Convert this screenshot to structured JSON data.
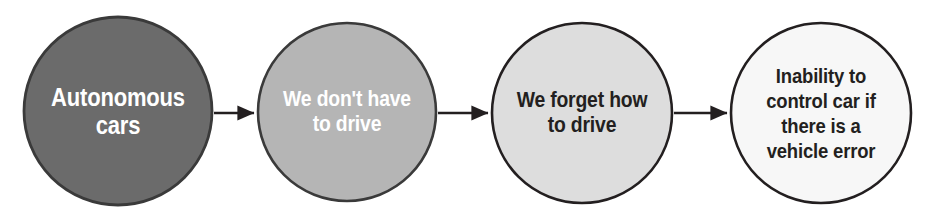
{
  "diagram": {
    "type": "flowchart",
    "orientation": "left-to-right",
    "title": "",
    "background_color": "#ffffff",
    "nodes": [
      {
        "id": "node-1",
        "shape": "circle",
        "label": "Autonomous\ncars",
        "fill_color": "#6b6b6b",
        "stroke_color": "#3a3a3a",
        "text_color": "#ffffff",
        "cx": 118,
        "cy": 111,
        "r": 94
      },
      {
        "id": "node-2",
        "shape": "circle",
        "label": "We don't have\nto drive",
        "fill_color": "#b5b5b5",
        "stroke_color": "#3a3a3a",
        "text_color": "#ffffff",
        "cx": 347,
        "cy": 112,
        "r": 89
      },
      {
        "id": "node-3",
        "shape": "circle",
        "label": "We forget how\nto drive",
        "fill_color": "#dddddd",
        "stroke_color": "#231f20",
        "text_color": "#231f20",
        "cx": 582,
        "cy": 113,
        "r": 90
      },
      {
        "id": "node-4",
        "shape": "circle",
        "label": "Inability to\ncontrol car if\nthere is a\nvehicle error",
        "fill_color": "#f7f7f7",
        "stroke_color": "#231f20",
        "text_color": "#231f20",
        "cx": 821,
        "cy": 113,
        "r": 90
      }
    ],
    "edges": [
      {
        "id": "edge-1",
        "from": "node-1",
        "to": "node-2",
        "label": "",
        "color": "#231f20",
        "x1": 214,
        "x2": 256,
        "y": 113
      },
      {
        "id": "edge-2",
        "from": "node-2",
        "to": "node-3",
        "label": "",
        "color": "#231f20",
        "x1": 438,
        "x2": 490,
        "y": 113
      },
      {
        "id": "edge-3",
        "from": "node-3",
        "to": "node-4",
        "label": "",
        "color": "#231f20",
        "x1": 674,
        "x2": 729,
        "y": 113
      }
    ]
  }
}
